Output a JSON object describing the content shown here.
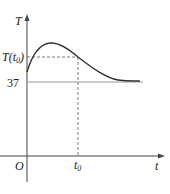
{
  "diagram": {
    "type": "function-graph",
    "axes": {
      "x_label": "t",
      "y_label": "T",
      "origin_label": "O"
    },
    "marks": {
      "t0_label": "t",
      "t0_sub": "0",
      "T_t0_label_prefix": "T(t",
      "T_t0_label_sub": "0",
      "T_t0_label_suffix": ")",
      "baseline_value": "37"
    },
    "curve": {
      "description": "Temperature rises from above 37 to a maximum, then decreases and approaches asymptote T = 37",
      "color": "#333333"
    },
    "baseline_color": "#999999",
    "dashed_color": "#555555"
  }
}
